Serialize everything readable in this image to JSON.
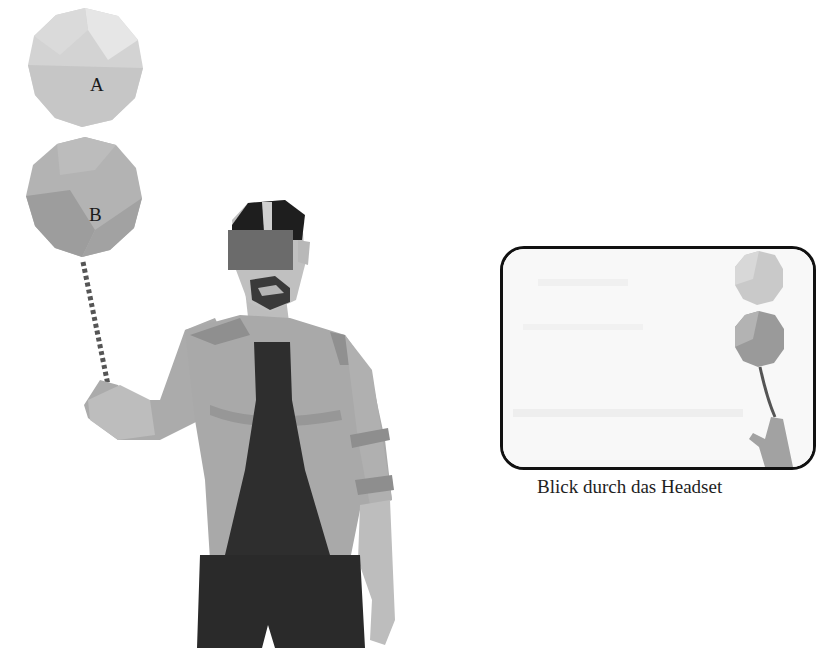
{
  "figure": {
    "balloons": [
      {
        "label": "A",
        "color": "#cfcfcf"
      },
      {
        "label": "B",
        "color": "#a9a9a9"
      }
    ],
    "person": {
      "jacket_color": "#a8a8a8",
      "shirt_color": "#2e2e2e",
      "pants_color": "#2a2a2a",
      "skin_color": "#c2c2c2",
      "headset_color": "#6b6b6b"
    },
    "headset_view": {
      "caption": "Blick durch das Headset",
      "border_color": "#111111"
    }
  }
}
